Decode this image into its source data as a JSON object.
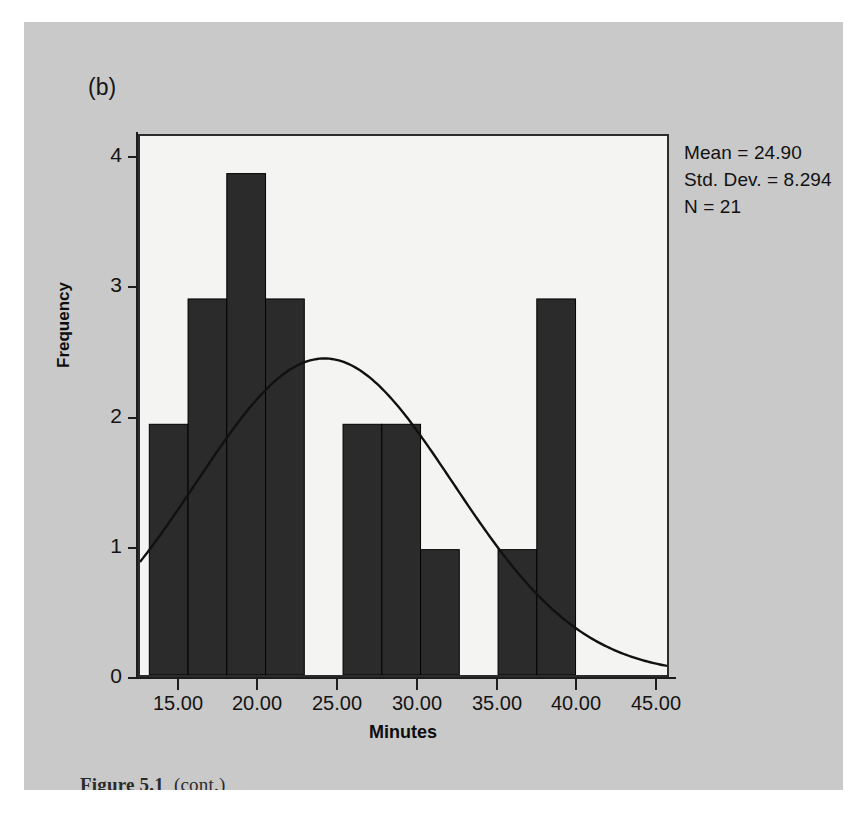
{
  "figure": {
    "subfigure_label": "(b)",
    "caption_prefix": "Figure 5.1",
    "caption_suffix": "(cont.)",
    "panel_color": "#c9c9c9",
    "plot_background": "#f4f4f2",
    "bar_color": "#2b2b2b",
    "axis_color": "#1d1d1d"
  },
  "stats": {
    "mean_line": "Mean = 24.90",
    "stddev_line": "Std. Dev. = 8.294",
    "n_line": "N = 21"
  },
  "chart_data": {
    "type": "bar",
    "title": "",
    "subtitle": "",
    "xlabel": "Minutes",
    "ylabel": "Frequency",
    "xlim": [
      13.0,
      47.0
    ],
    "ylim": [
      0,
      4.3
    ],
    "grid": false,
    "legend": null,
    "x_tick_labels": [
      "15.00",
      "20.00",
      "25.00",
      "30.00",
      "35.00",
      "40.00",
      "45.00"
    ],
    "x_tick_values": [
      15,
      20,
      25,
      30,
      35,
      40,
      45
    ],
    "y_tick_labels": [
      "0",
      "1",
      "2",
      "3",
      "4"
    ],
    "y_tick_values": [
      0,
      1,
      2,
      3,
      4
    ],
    "bin_width": 2.5,
    "bins": [
      {
        "start": 13.6,
        "end": 16.1,
        "value": 2
      },
      {
        "start": 16.1,
        "end": 18.6,
        "value": 3
      },
      {
        "start": 18.6,
        "end": 21.1,
        "value": 4
      },
      {
        "start": 21.1,
        "end": 23.6,
        "value": 3
      },
      {
        "start": 23.6,
        "end": 26.1,
        "value": 0
      },
      {
        "start": 26.1,
        "end": 28.6,
        "value": 2
      },
      {
        "start": 28.6,
        "end": 31.1,
        "value": 2
      },
      {
        "start": 31.1,
        "end": 33.6,
        "value": 1
      },
      {
        "start": 33.6,
        "end": 36.1,
        "value": 0
      },
      {
        "start": 36.1,
        "end": 38.6,
        "value": 1
      },
      {
        "start": 38.6,
        "end": 41.1,
        "value": 3
      }
    ],
    "categories": [
      "13.6-16.1",
      "16.1-18.6",
      "18.6-21.1",
      "21.1-23.6",
      "23.6-26.1",
      "26.1-28.6",
      "28.6-31.1",
      "31.1-33.6",
      "33.6-36.1",
      "36.1-38.6",
      "38.6-41.1"
    ],
    "values": [
      2,
      3,
      4,
      3,
      0,
      2,
      2,
      1,
      0,
      1,
      3
    ],
    "overlay": {
      "type": "normal-curve",
      "mean": 24.9,
      "std_dev": 8.294,
      "n": 21,
      "annotation": "normal distribution curve"
    }
  }
}
